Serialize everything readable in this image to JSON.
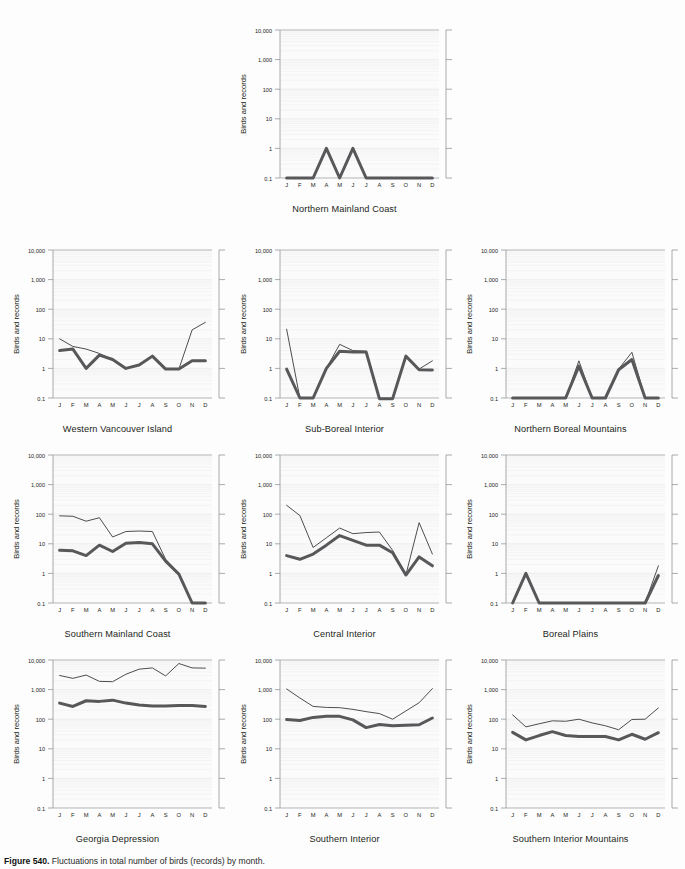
{
  "figure": {
    "caption_label": "Figure 540.",
    "caption_text": "Fluctuations in total number of birds (records) by month.",
    "y_axis_title": "Birds and records",
    "y_ticks": [
      "10,000",
      "1,000",
      "100",
      "10",
      "1",
      "0.1"
    ],
    "x_ticks": [
      "J",
      "F",
      "M",
      "A",
      "M",
      "J",
      "J",
      "A",
      "S",
      "O",
      "N",
      "D"
    ],
    "colors": {
      "records_line": "#3a3a3c",
      "birds_line": "#58585b",
      "axis": "#939598",
      "grid": "#ededee",
      "text": "#231f20",
      "background": "#fdfdfd"
    },
    "series_names": {
      "thin": "records",
      "thick": "birds"
    }
  },
  "chart_data": [
    {
      "type": "line",
      "title": "Northern Mainland Coast",
      "xlabel": "",
      "ylabel": "Birds and records",
      "categories": [
        "J",
        "F",
        "M",
        "A",
        "M",
        "J",
        "J",
        "A",
        "S",
        "O",
        "N",
        "D"
      ],
      "ylim": [
        0.1,
        10000
      ],
      "yscale": "log",
      "grid": true,
      "legend": "none",
      "series": [
        {
          "name": "records",
          "values": [
            0.1,
            0.1,
            0.1,
            1,
            0.1,
            1,
            0.1,
            0.1,
            0.1,
            0.1,
            0.1,
            0.1
          ]
        },
        {
          "name": "birds",
          "values": [
            0.1,
            0.1,
            0.1,
            1,
            0.1,
            1,
            0.1,
            0.1,
            0.1,
            0.1,
            0.1,
            0.1
          ]
        }
      ]
    },
    {
      "type": "line",
      "title": "Western Vancouver Island",
      "xlabel": "",
      "ylabel": "Birds and records",
      "categories": [
        "J",
        "F",
        "M",
        "A",
        "M",
        "J",
        "J",
        "A",
        "S",
        "O",
        "N",
        "D"
      ],
      "ylim": [
        0.1,
        10000
      ],
      "yscale": "log",
      "grid": true,
      "legend": "none",
      "series": [
        {
          "name": "records",
          "values": [
            10,
            5.5,
            4.5,
            3.2,
            2.0,
            1.0,
            1.3,
            2.6,
            1.0,
            0.95,
            20,
            36
          ]
        },
        {
          "name": "birds",
          "values": [
            4.0,
            4.5,
            1.0,
            2.8,
            2.0,
            1.0,
            1.3,
            2.6,
            0.95,
            0.95,
            1.8,
            1.8
          ]
        }
      ]
    },
    {
      "type": "line",
      "title": "Sub-Boreal Interior",
      "xlabel": "",
      "ylabel": "Birds and records",
      "categories": [
        "J",
        "F",
        "M",
        "A",
        "M",
        "J",
        "J",
        "A",
        "S",
        "O",
        "N",
        "D"
      ],
      "ylim": [
        0.1,
        10000
      ],
      "yscale": "log",
      "grid": true,
      "legend": "none",
      "series": [
        {
          "name": "records",
          "values": [
            21,
            0.1,
            0.1,
            1.0,
            6.5,
            4.0,
            3.8,
            0.095,
            0.095,
            2.6,
            0.95,
            1.8
          ]
        },
        {
          "name": "birds",
          "values": [
            0.95,
            0.1,
            0.1,
            1.0,
            3.8,
            3.6,
            3.6,
            0.095,
            0.095,
            2.6,
            0.9,
            0.88
          ]
        }
      ]
    },
    {
      "type": "line",
      "title": "Northern Boreal Mountains",
      "xlabel": "",
      "ylabel": "Birds and records",
      "categories": [
        "J",
        "F",
        "M",
        "A",
        "M",
        "J",
        "J",
        "A",
        "S",
        "O",
        "N",
        "D"
      ],
      "ylim": [
        0.1,
        10000
      ],
      "yscale": "log",
      "grid": true,
      "legend": "none",
      "series": [
        {
          "name": "records",
          "values": [
            0.1,
            0.1,
            0.1,
            0.1,
            0.1,
            1.8,
            0.1,
            0.1,
            0.95,
            3.5,
            0.1,
            0.1
          ]
        },
        {
          "name": "birds",
          "values": [
            0.1,
            0.1,
            0.1,
            0.1,
            0.1,
            1.2,
            0.1,
            0.1,
            0.9,
            2.0,
            0.1,
            0.1
          ]
        }
      ]
    },
    {
      "type": "line",
      "title": "Southern Mainland Coast",
      "xlabel": "",
      "ylabel": "Birds and records",
      "categories": [
        "J",
        "F",
        "M",
        "A",
        "M",
        "J",
        "J",
        "A",
        "S",
        "O",
        "N",
        "D"
      ],
      "ylim": [
        0.1,
        10000
      ],
      "yscale": "log",
      "grid": true,
      "legend": "none",
      "series": [
        {
          "name": "records",
          "values": [
            88,
            85,
            58,
            76,
            17,
            26,
            27,
            26,
            3.0,
            1.0,
            0.1,
            0.1
          ]
        },
        {
          "name": "birds",
          "values": [
            6.0,
            5.8,
            4.0,
            9.0,
            5.5,
            10.5,
            11,
            10,
            2.6,
            0.95,
            0.1,
            0.1
          ]
        }
      ]
    },
    {
      "type": "line",
      "title": "Central Interior",
      "xlabel": "",
      "ylabel": "Birds and records",
      "categories": [
        "J",
        "F",
        "M",
        "A",
        "M",
        "J",
        "J",
        "A",
        "S",
        "O",
        "N",
        "D"
      ],
      "ylim": [
        0.1,
        10000
      ],
      "yscale": "log",
      "grid": true,
      "legend": "none",
      "series": [
        {
          "name": "records",
          "values": [
            200,
            90,
            7.5,
            16,
            34,
            22,
            24,
            25,
            6.0,
            0.9,
            52,
            4.5
          ]
        },
        {
          "name": "birds",
          "values": [
            4.0,
            3.0,
            4.5,
            9.0,
            19,
            13,
            9.0,
            9.0,
            5.0,
            0.88,
            3.6,
            1.8
          ]
        }
      ]
    },
    {
      "type": "line",
      "title": "Boreal Plains",
      "xlabel": "",
      "ylabel": "Birds and records",
      "categories": [
        "J",
        "F",
        "M",
        "A",
        "M",
        "J",
        "J",
        "A",
        "S",
        "O",
        "N",
        "D"
      ],
      "ylim": [
        0.1,
        10000
      ],
      "yscale": "log",
      "grid": true,
      "legend": "none",
      "series": [
        {
          "name": "records",
          "values": [
            0.1,
            1.0,
            0.1,
            0.1,
            0.1,
            0.1,
            0.1,
            0.1,
            0.1,
            0.1,
            0.1,
            1.8
          ]
        },
        {
          "name": "birds",
          "values": [
            0.1,
            1.0,
            0.1,
            0.1,
            0.1,
            0.1,
            0.1,
            0.1,
            0.1,
            0.1,
            0.1,
            0.85
          ]
        }
      ]
    },
    {
      "type": "line",
      "title": "Georgia Depression",
      "xlabel": "",
      "ylabel": "Birds and records",
      "categories": [
        "J",
        "F",
        "M",
        "A",
        "M",
        "J",
        "J",
        "A",
        "S",
        "O",
        "N",
        "D"
      ],
      "ylim": [
        0.1,
        10000
      ],
      "yscale": "log",
      "grid": true,
      "legend": "none",
      "series": [
        {
          "name": "records",
          "values": [
            3000,
            2400,
            3100,
            1900,
            1850,
            3300,
            4900,
            5400,
            2900,
            7600,
            5400,
            5300
          ]
        },
        {
          "name": "birds",
          "values": [
            350,
            270,
            420,
            400,
            440,
            350,
            300,
            280,
            280,
            290,
            290,
            270
          ]
        }
      ]
    },
    {
      "type": "line",
      "title": "Southern Interior",
      "xlabel": "",
      "ylabel": "Birds and records",
      "categories": [
        "J",
        "F",
        "M",
        "A",
        "M",
        "J",
        "J",
        "A",
        "S",
        "O",
        "N",
        "D"
      ],
      "ylim": [
        0.1,
        10000
      ],
      "yscale": "log",
      "grid": true,
      "legend": "none",
      "series": [
        {
          "name": "records",
          "values": [
            1050,
            520,
            270,
            250,
            245,
            215,
            180,
            155,
            100,
            190,
            360,
            1080
          ]
        },
        {
          "name": "birds",
          "values": [
            97,
            90,
            115,
            125,
            125,
            95,
            52,
            66,
            60,
            62,
            65,
            110
          ]
        }
      ]
    },
    {
      "type": "line",
      "title": "Southern Interior Mountains",
      "xlabel": "",
      "ylabel": "Birds and records",
      "categories": [
        "J",
        "F",
        "M",
        "A",
        "M",
        "J",
        "J",
        "A",
        "S",
        "O",
        "N",
        "D"
      ],
      "ylim": [
        0.1,
        10000
      ],
      "yscale": "log",
      "grid": true,
      "legend": "none",
      "series": [
        {
          "name": "records",
          "values": [
            140,
            55,
            70,
            88,
            85,
            100,
            75,
            60,
            44,
            98,
            100,
            240
          ]
        },
        {
          "name": "birds",
          "values": [
            36,
            20,
            28,
            38,
            28,
            26,
            26,
            26,
            20,
            31,
            21,
            35
          ]
        }
      ]
    }
  ],
  "panel_layout": [
    {
      "index": 0,
      "x": 232,
      "y": 18
    },
    {
      "index": 1,
      "x": 5,
      "y": 238
    },
    {
      "index": 2,
      "x": 232,
      "y": 238
    },
    {
      "index": 3,
      "x": 458,
      "y": 238
    },
    {
      "index": 4,
      "x": 5,
      "y": 443
    },
    {
      "index": 5,
      "x": 232,
      "y": 443
    },
    {
      "index": 6,
      "x": 458,
      "y": 443
    },
    {
      "index": 7,
      "x": 5,
      "y": 648
    },
    {
      "index": 8,
      "x": 232,
      "y": 648
    },
    {
      "index": 9,
      "x": 458,
      "y": 648
    }
  ]
}
